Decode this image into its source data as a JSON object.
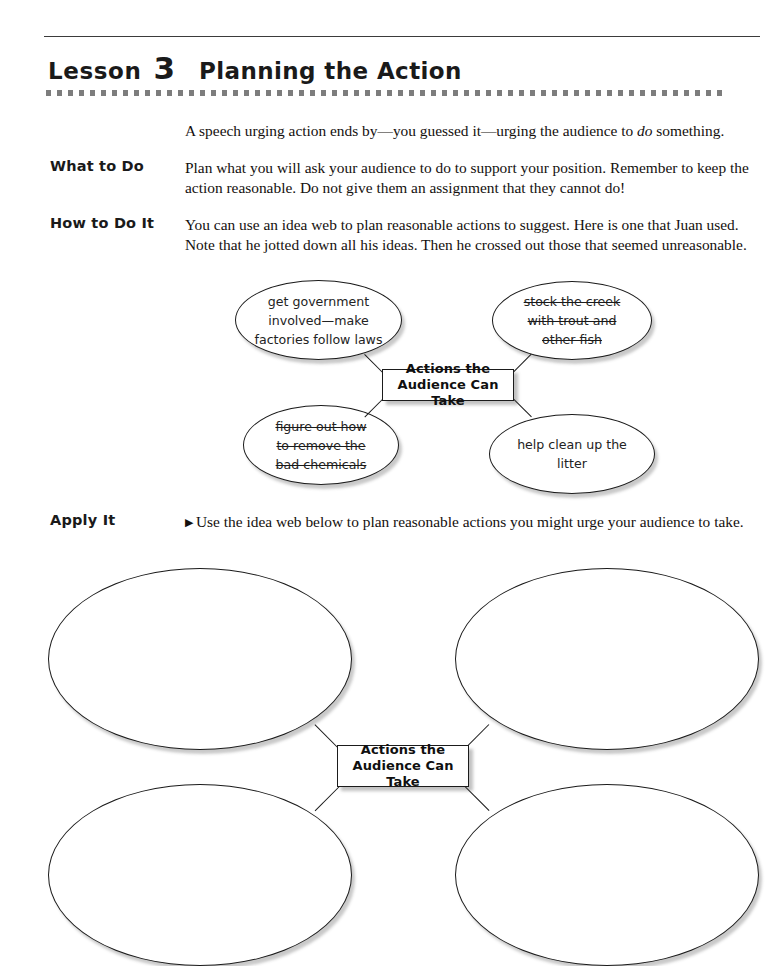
{
  "page": {
    "lesson_word": "Lesson",
    "lesson_number": "3",
    "lesson_title": "Planning the Action"
  },
  "intro": {
    "text_before_italic": "A speech urging action ends by—you guessed it—urging the audience to ",
    "italic_word": "do",
    "text_after_italic": " something."
  },
  "sections": [
    {
      "label": "What to Do",
      "body": "Plan what you will ask your audience to do to support your position. Remember to keep the action reasonable. Do not give them an assignment that they cannot do!"
    },
    {
      "label": "How to Do It",
      "body": "You can use an idea web to plan reasonable actions to suggest. Here is one that Juan used. Note that he jotted down all his ideas. Then he crossed out those that seemed unreasonable."
    },
    {
      "label": "Apply It",
      "bullet": "▶",
      "body": "Use the idea web below to plan reasonable actions you might urge your audience to take."
    }
  ],
  "example_web": {
    "center_label_line1": "Actions the",
    "center_label_line2": "Audience Can Take",
    "ovals": [
      {
        "position": "top-left",
        "struck": false,
        "lines": [
          "get government",
          "involved—make",
          "factories follow laws"
        ]
      },
      {
        "position": "top-right",
        "struck": true,
        "lines": [
          "stock the creek",
          "with trout and",
          "other fish"
        ]
      },
      {
        "position": "bottom-left",
        "struck": true,
        "lines": [
          "figure out how",
          "to remove the",
          "bad chemicals"
        ]
      },
      {
        "position": "bottom-right",
        "struck": false,
        "lines": [
          "help clean up the",
          "litter"
        ]
      }
    ]
  },
  "blank_web": {
    "center_label_line1": "Actions the",
    "center_label_line2": "Audience Can Take",
    "ovals": [
      {
        "position": "top-left",
        "lines": []
      },
      {
        "position": "top-right",
        "lines": []
      },
      {
        "position": "bottom-left",
        "lines": []
      },
      {
        "position": "bottom-right",
        "lines": []
      }
    ]
  },
  "colors": {
    "ink": "#111111",
    "rule": "#3b3b3b",
    "dots": "#7d7d7d"
  }
}
